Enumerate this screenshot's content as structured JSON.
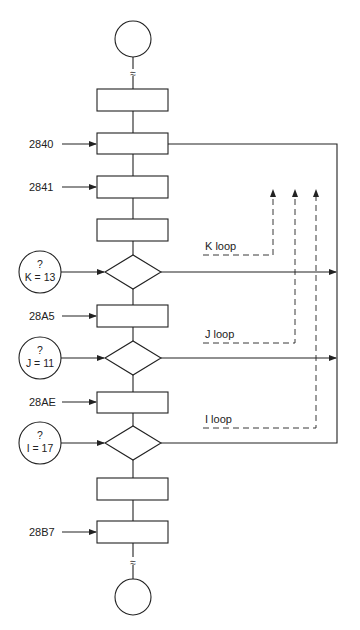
{
  "diagram": {
    "type": "flowchart",
    "addresses": {
      "a2840": "2840",
      "a2841": "2841",
      "a28A5": "28A5",
      "a28AE": "28AE",
      "a28B7": "28B7"
    },
    "conditions": {
      "k": {
        "q": "?",
        "expr": "K = 13"
      },
      "j": {
        "q": "?",
        "expr": "J = 11"
      },
      "i": {
        "q": "?",
        "expr": "I = 17"
      }
    },
    "loops": {
      "k": "K loop",
      "j": "J loop",
      "i": "I loop"
    },
    "break_symbol": "≈",
    "colors": {
      "line": "#222222",
      "background": "#ffffff"
    }
  }
}
